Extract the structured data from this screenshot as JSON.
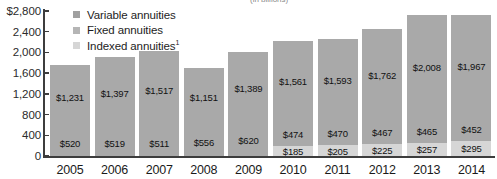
{
  "chart": {
    "title_partial": "(in billions)",
    "currency_prefix": "$"
  },
  "legend": {
    "items": [
      {
        "label": "Variable annuities",
        "color": "#a0a0a0"
      },
      {
        "label": "Fixed annuities",
        "color": "#b5b5b5"
      },
      {
        "label": "Indexed annuities",
        "footnote": "1",
        "color": "#d6d6d6"
      }
    ]
  },
  "chart_data": {
    "type": "bar",
    "stacked": true,
    "title": "(in billions)",
    "xlabel": "",
    "ylabel": "",
    "ylim": [
      0,
      2800
    ],
    "yticks": [
      0,
      400,
      800,
      1200,
      1600,
      2000,
      2400,
      2800
    ],
    "ytick_labels": [
      "0",
      "400",
      "800",
      "1,200",
      "1,600",
      "2,000",
      "2,400",
      "$2,800"
    ],
    "grid": false,
    "legend_position": "top-left",
    "categories": [
      "2005",
      "2006",
      "2007",
      "2008",
      "2009",
      "2010",
      "2011",
      "2012",
      "2013",
      "2014"
    ],
    "series": [
      {
        "name": "Variable annuities",
        "color": "#a9a9a9",
        "values": [
          1231,
          1397,
          1517,
          1151,
          1389,
          1561,
          1593,
          1762,
          2008,
          1967
        ],
        "labels": [
          "$1,231",
          "$1,397",
          "$1,517",
          "$1,151",
          "$1,389",
          "$1,561",
          "$1,593",
          "$1,762",
          "$2,008",
          "$1,967"
        ]
      },
      {
        "name": "Fixed annuities",
        "color": "#a9a9a9",
        "values": [
          520,
          519,
          511,
          556,
          620,
          474,
          470,
          467,
          465,
          452
        ],
        "labels": [
          "$520",
          "$519",
          "$511",
          "$556",
          "$620",
          "$474",
          "$470",
          "$467",
          "$465",
          "$452"
        ]
      },
      {
        "name": "Indexed annuities",
        "color": "#d6d6d6",
        "values": [
          0,
          0,
          0,
          0,
          0,
          185,
          205,
          225,
          257,
          295
        ],
        "labels": [
          "",
          "",
          "",
          "",
          "",
          "$185",
          "$205",
          "$225",
          "$257",
          "$295"
        ]
      }
    ],
    "totals": [
      1751,
      1916,
      2028,
      1707,
      2009,
      2220,
      2268,
      2454,
      2730,
      2714
    ]
  }
}
